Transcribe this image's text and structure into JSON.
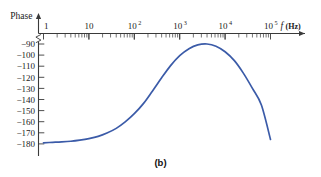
{
  "caption": "(b)",
  "colors": {
    "curve": "#3b5ba8",
    "axis": "#3a3a3a",
    "text": "#1b1b1b",
    "background": "#ffffff"
  },
  "chart_data": {
    "type": "line",
    "title": "",
    "subtitle": "",
    "xlabel": "f (Hz)",
    "xlabel_variable": "f",
    "xlabel_unit": "(Hz)",
    "ylabel": "Phase",
    "xscale": "log",
    "yscale": "linear",
    "xlim": [
      1,
      100000
    ],
    "ylim": [
      -185,
      -86
    ],
    "grid": false,
    "legend": null,
    "y_axis_break": true,
    "xticks": [
      {
        "value": 1,
        "label": "1",
        "mantissa": "",
        "exponent": ""
      },
      {
        "value": 10,
        "label": "10",
        "mantissa": "",
        "exponent": ""
      },
      {
        "value": 100,
        "label": "10^2",
        "mantissa": "10",
        "exponent": "2"
      },
      {
        "value": 1000,
        "label": "10^3",
        "mantissa": "10",
        "exponent": "3"
      },
      {
        "value": 10000,
        "label": "10^4",
        "mantissa": "10",
        "exponent": "4"
      },
      {
        "value": 100000,
        "label": "10^5",
        "mantissa": "10",
        "exponent": "5"
      }
    ],
    "yticks": [
      -90,
      -100,
      -110,
      -120,
      -130,
      -140,
      -150,
      -160,
      -170,
      -180
    ],
    "ytick_labels": [
      "−90",
      "−100",
      "−110",
      "−120",
      "−130",
      "−140",
      "−150",
      "−160",
      "−170",
      "−180"
    ],
    "series": [
      {
        "name": "phase",
        "color": "#3b5ba8",
        "x": [
          1,
          1.6,
          2.5,
          4,
          6.3,
          10,
          16,
          25,
          40,
          63,
          100,
          160,
          250,
          400,
          630,
          1000,
          1600,
          2500,
          4000,
          6300,
          10000,
          16000,
          25000,
          40000,
          63000,
          100000
        ],
        "y": [
          -179.0,
          -178.6,
          -178.2,
          -177.6,
          -176.6,
          -175.2,
          -173.2,
          -170.2,
          -166.0,
          -160.2,
          -152.8,
          -143.5,
          -132.5,
          -120.5,
          -109.5,
          -100.5,
          -94.2,
          -90.8,
          -90.0,
          -92.0,
          -97.0,
          -105.0,
          -116.0,
          -130.0,
          -145.0,
          -158.0
        ],
        "y_endpoint_right": -176.0
      }
    ],
    "annotations": []
  }
}
